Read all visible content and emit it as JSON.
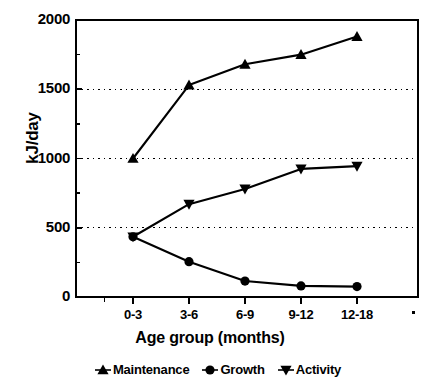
{
  "chart_data": {
    "type": "line",
    "title": "",
    "xlabel": "Age group (months)",
    "ylabel": "kJ/day",
    "categories": [
      "0-3",
      "3-6",
      "6-9",
      "9-12",
      "12-18"
    ],
    "ylim": [
      0,
      2000
    ],
    "yticks": [
      0,
      500,
      1000,
      1500,
      2000
    ],
    "ytick_labels": [
      "0",
      "500",
      "1000",
      "1500",
      "2000"
    ],
    "grid": "horizontal-dotted",
    "legend_position": "bottom",
    "series": [
      {
        "name": "Maintenance",
        "marker": "triangle-up",
        "color": "#000000",
        "values": [
          1000,
          1530,
          1680,
          1750,
          1880
        ]
      },
      {
        "name": "Growth",
        "marker": "circle",
        "color": "#000000",
        "values": [
          435,
          255,
          115,
          80,
          75
        ]
      },
      {
        "name": "Activity",
        "marker": "triangle-down",
        "color": "#000000",
        "values": [
          435,
          670,
          780,
          925,
          945
        ]
      }
    ]
  },
  "legend": {
    "items": [
      {
        "label": "Maintenance",
        "marker": "triangle-up-marker-icon"
      },
      {
        "label": "Growth",
        "marker": "circle-marker-icon"
      },
      {
        "label": "Activity",
        "marker": "triangle-down-marker-icon"
      }
    ]
  },
  "colors": {
    "ink": "#000000",
    "background": "#ffffff",
    "grid": "#000000"
  }
}
